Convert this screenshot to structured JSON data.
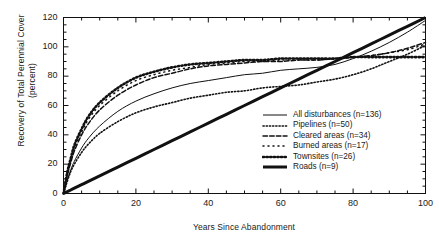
{
  "chart_data": {
    "type": "line",
    "title": "",
    "xlabel": "Years Since Abandonment",
    "ylabel": "Recovery of Total Perennial Cover (percent)",
    "xlim": [
      0,
      100
    ],
    "ylim": [
      0,
      120
    ],
    "xticks": [
      0,
      20,
      40,
      60,
      80,
      100
    ],
    "yticks": [
      0,
      20,
      40,
      60,
      80,
      100,
      120
    ],
    "xminor_step": 5,
    "yminor_step": 5,
    "grid": false,
    "legend_position": "inside-lower-right",
    "x": [
      0,
      1,
      2,
      3,
      5,
      7,
      10,
      15,
      20,
      25,
      30,
      35,
      40,
      45,
      50,
      55,
      60,
      65,
      70,
      75,
      80,
      85,
      90,
      95,
      100
    ],
    "series": [
      {
        "name": "All disturbances (n=136)",
        "label": "All disturbances (n=136)",
        "n": 136,
        "style": "solid-thin",
        "values": [
          0,
          9,
          16,
          22,
          31,
          38,
          46,
          56,
          63,
          68,
          72,
          75,
          77,
          79,
          81,
          82,
          84,
          85,
          86,
          88,
          92,
          97,
          103,
          110,
          118
        ]
      },
      {
        "name": "Pipelines (n=50)",
        "label": "Pipelines (n=50)",
        "n": 50,
        "style": "fine-dotted",
        "values": [
          0,
          8,
          15,
          20,
          28,
          34,
          41,
          49,
          55,
          59,
          62,
          65,
          67,
          69,
          70,
          72,
          73,
          74,
          76,
          78,
          81,
          85,
          90,
          95,
          101
        ]
      },
      {
        "name": "Cleared areas (n=34)",
        "label": "Cleared areas (n=34)",
        "n": 34,
        "style": "dashed",
        "values": [
          0,
          12,
          21,
          29,
          40,
          48,
          57,
          67,
          74,
          79,
          82,
          85,
          87,
          88,
          89,
          90,
          90,
          91,
          91,
          92,
          93,
          94,
          96,
          99,
          103
        ]
      },
      {
        "name": "Burned areas (n=17)",
        "label": "Burned areas (n=17)",
        "n": 17,
        "style": "sparse-dotted",
        "values": [
          0,
          13,
          23,
          31,
          42,
          51,
          60,
          70,
          77,
          81,
          84,
          86,
          88,
          89,
          90,
          90,
          91,
          91,
          91,
          92,
          93,
          94,
          96,
          98,
          102
        ]
      },
      {
        "name": "Townsites (n=26)",
        "label": "Townsites (n=26)",
        "n": 26,
        "style": "dot-dash-heavy",
        "values": [
          0,
          14,
          24,
          33,
          44,
          53,
          62,
          72,
          79,
          83,
          86,
          88,
          89,
          90,
          91,
          91,
          92,
          92,
          92,
          92,
          93,
          93,
          93,
          93,
          93
        ]
      },
      {
        "name": "Roads (n=9)",
        "label": "Roads (n=9)",
        "n": 9,
        "style": "solid-thick",
        "values": [
          0,
          1.2,
          2.4,
          3.6,
          6,
          8.4,
          12,
          18,
          24,
          30,
          36,
          42,
          48,
          54,
          60,
          66,
          72,
          78,
          84,
          90,
          96,
          102,
          108,
          114,
          120
        ]
      }
    ]
  },
  "legend": {
    "items": [
      {
        "label": "All disturbances (n=136)"
      },
      {
        "label": "Pipelines (n=50)"
      },
      {
        "label": "Cleared areas (n=34)"
      },
      {
        "label": "Burned areas (n=17)"
      },
      {
        "label": "Townsites (n=26)"
      },
      {
        "label": "Roads (n=9)"
      }
    ]
  }
}
